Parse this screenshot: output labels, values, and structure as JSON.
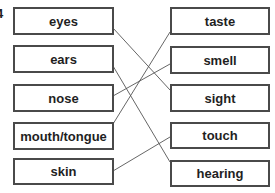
{
  "question_number": "4",
  "left_column": [
    {
      "label": "eyes"
    },
    {
      "label": "ears"
    },
    {
      "label": "nose"
    },
    {
      "label": "mouth/tongue"
    },
    {
      "label": "skin"
    }
  ],
  "right_column": [
    {
      "label": "taste"
    },
    {
      "label": "smell"
    },
    {
      "label": "sight"
    },
    {
      "label": "touch"
    },
    {
      "label": "hearing"
    }
  ],
  "connections": [
    {
      "from": "eyes",
      "to": "sight"
    },
    {
      "from": "ears",
      "to": "hearing"
    },
    {
      "from": "nose",
      "to": "smell"
    },
    {
      "from": "mouth/tongue",
      "to": "taste"
    },
    {
      "from": "skin",
      "to": "touch"
    }
  ]
}
